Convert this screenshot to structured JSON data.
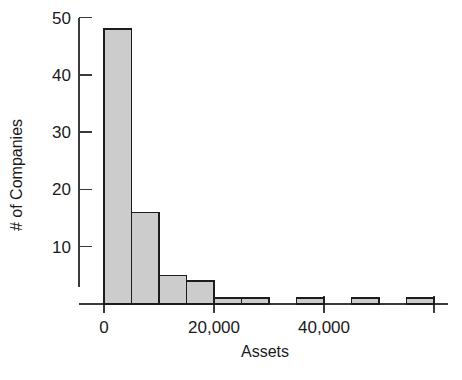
{
  "chart_data": {
    "type": "bar",
    "title": "",
    "subtitle": "",
    "xlabel": "Assets",
    "ylabel": "# of Companies",
    "grid": false,
    "legend": false,
    "legend_position": "none",
    "bin_width": 5000,
    "xlim": [
      0,
      60000
    ],
    "ylim": [
      0,
      50
    ],
    "x_ticks": [
      0,
      20000,
      40000,
      60000
    ],
    "x_tick_labels": [
      "0",
      "20,000",
      "40,000",
      ""
    ],
    "y_ticks": [
      10,
      20,
      30,
      40,
      50
    ],
    "y_tick_labels": [
      "10",
      "20",
      "30",
      "40",
      "50"
    ],
    "categories": [
      "0-5,000",
      "5,000-10,000",
      "10,000-15,000",
      "15,000-20,000",
      "20,000-25,000",
      "25,000-30,000",
      "30,000-35,000",
      "35,000-40,000",
      "40,000-45,000",
      "45,000-50,000",
      "50,000-55,000",
      "55,000-60,000"
    ],
    "bin_starts": [
      0,
      5000,
      10000,
      15000,
      20000,
      25000,
      30000,
      35000,
      40000,
      45000,
      50000,
      55000
    ],
    "values": [
      48,
      16,
      5,
      4,
      1,
      1,
      0,
      1,
      0,
      1,
      0,
      1
    ],
    "bar_fill_color": "#cccccc",
    "bar_edge_color": "#1c1c1c",
    "axis_color": "#3a3a3a",
    "background_color": "#ffffff"
  },
  "figure": {
    "plot_left_px": 104,
    "plot_baseline_px": 304,
    "px_per_10_units": 57.3,
    "px_per_20000_assets": 110
  }
}
